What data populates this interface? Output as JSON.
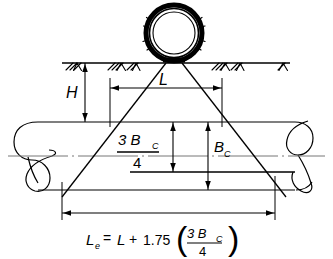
{
  "figure": {
    "type": "engineering-cross-section-diagram"
  },
  "labels": {
    "depth_of_cover": "H",
    "tire_contact_length": "L",
    "pipe_outside_diameter": "B",
    "pipe_diameter_subscript": "C",
    "three_quarters_numerator": "3 B",
    "three_quarters_denominator": "4",
    "effective_length_symbol": "L",
    "effective_length_subscript": "e",
    "equation_equals": "=",
    "equation_plus": "+",
    "equation_coefficient": "1.75",
    "paren_open": "(",
    "paren_close": ")",
    "equation_full": "Le = L + 1.75 (3Bc/4)"
  },
  "elements": {
    "wheel": "tire-wheel",
    "ground": "ground-surface-line",
    "hatching": "ground-hatching",
    "contact_patch": "tire-contact-patch",
    "pipe": "buried-pipe",
    "load_spread": "load-distribution-lines",
    "centerline": "pipe-centerline"
  },
  "colors": {
    "line": "#000000",
    "background": "#ffffff",
    "fill": "#ffffff"
  },
  "dimensions": {
    "H": "H",
    "L": "L",
    "Bc": "Bc",
    "three_quarter_Bc": "3Bc/4",
    "Le": "Le"
  }
}
